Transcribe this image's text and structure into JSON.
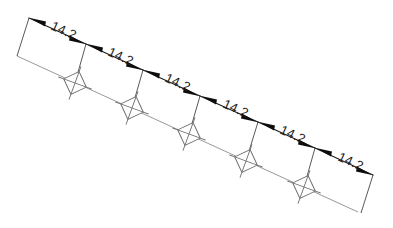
{
  "drawing": {
    "title": "Chained linear dimension drawing",
    "units_implied": "mm",
    "background_color": "#ffffff",
    "line_color": "#161616",
    "baseline_color": "#8d8d8d",
    "marker_color": "#6f6f6f",
    "text_color": "#1b1b1b",
    "axis_angle_degrees": -25,
    "segment_count": 6,
    "marker_count": 5,
    "marker_symbol": "crossed-square",
    "dimensions": [
      {
        "index": 1,
        "label": "14.2",
        "value": 14.2
      },
      {
        "index": 2,
        "label": "14.2",
        "value": 14.2
      },
      {
        "index": 3,
        "label": "14.2",
        "value": 14.2
      },
      {
        "index": 4,
        "label": "14.2",
        "value": 14.2
      },
      {
        "index": 5,
        "label": "14.2",
        "value": 14.2
      },
      {
        "index": 6,
        "label": "14.2",
        "value": 14.2
      }
    ],
    "total_label": "85.2"
  }
}
